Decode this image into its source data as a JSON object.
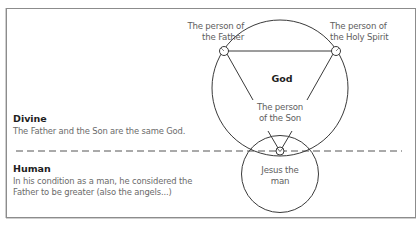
{
  "diagram": {
    "center_label": "God",
    "nodes": {
      "father": {
        "line1": "The person of",
        "line2": "the Father"
      },
      "holy_spirit": {
        "line1": "The person of",
        "line2": "the Holy Spirit"
      },
      "son": {
        "line1": "The person",
        "line2": "of the Son"
      },
      "jesus": {
        "line1": "Jesus the",
        "line2": "man"
      }
    },
    "sections": {
      "divine": {
        "title": "Divine",
        "text": "The Father and the Son are the same God."
      },
      "human": {
        "title": "Human",
        "line1": "In his condition as a man, he considered the",
        "line2": "Father to be greater (also the angels...)"
      }
    },
    "colors": {
      "stroke": "#3a3a3a",
      "frame": "#8c8c8c",
      "text": "#6a6a6a",
      "heading": "#1e1e1e"
    }
  }
}
